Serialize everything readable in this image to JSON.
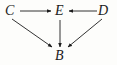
{
  "figure": {
    "kind": "directed-graph-diagram",
    "background_color": "#fdfdfb",
    "stroke_color": "#1c1c1c",
    "label_color": "#1c1c1c",
    "width": 117,
    "height": 65,
    "nodes": [
      {
        "id": "C",
        "label": "C",
        "x": 11,
        "y": 11
      },
      {
        "id": "E",
        "label": "E",
        "x": 60,
        "y": 11
      },
      {
        "id": "D",
        "label": "D",
        "x": 104,
        "y": 11
      },
      {
        "id": "B",
        "label": "B",
        "x": 60,
        "y": 56
      }
    ],
    "edges": [
      {
        "id": "C-to-E",
        "from": "C",
        "to": "E",
        "style": "horizontal-arrow",
        "direction": "right"
      },
      {
        "id": "D-to-E",
        "from": "D",
        "to": "E",
        "style": "horizontal-arrow",
        "direction": "left"
      },
      {
        "id": "E-to-B",
        "from": "E",
        "to": "B",
        "style": "vertical-arrow",
        "direction": "down"
      },
      {
        "id": "C-to-B",
        "from": "C",
        "to": "B",
        "style": "diagonal-arrow",
        "direction": "down-right"
      },
      {
        "id": "D-to-B",
        "from": "D",
        "to": "B",
        "style": "diagonal-arrow",
        "direction": "down-left"
      }
    ]
  }
}
